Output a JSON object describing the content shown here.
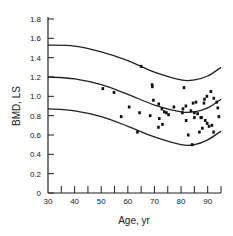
{
  "chart_data": {
    "type": "scatter",
    "title": "",
    "xlabel": "Age, yr",
    "ylabel": "BMD, LS",
    "xlim": [
      30,
      95
    ],
    "ylim": [
      0,
      1.8
    ],
    "xticks": [
      30,
      40,
      50,
      60,
      70,
      80,
      90
    ],
    "xminor_ticks": [
      35,
      45,
      55,
      65,
      75,
      85,
      95
    ],
    "yticks": [
      0,
      0.2,
      0.4,
      0.6,
      0.8,
      1.0,
      1.2,
      1.4,
      1.6,
      1.8
    ],
    "ytick_labels": [
      "0",
      "0.2",
      "0.4",
      "0.6",
      "0.8",
      "1.0",
      "1.2",
      "1.4",
      "1.6",
      "1.8"
    ],
    "grid": false,
    "legend": null,
    "reference_curves": [
      {
        "name": "upper",
        "x": [
          30,
          40,
          50,
          60,
          70,
          80,
          85,
          90,
          95
        ],
        "y": [
          1.53,
          1.52,
          1.46,
          1.37,
          1.25,
          1.17,
          1.17,
          1.21,
          1.3
        ]
      },
      {
        "name": "mean",
        "x": [
          30,
          40,
          50,
          60,
          70,
          80,
          85,
          90,
          95
        ],
        "y": [
          1.2,
          1.18,
          1.12,
          1.02,
          0.91,
          0.84,
          0.84,
          0.88,
          0.97
        ]
      },
      {
        "name": "lower",
        "x": [
          30,
          40,
          50,
          60,
          70,
          80,
          85,
          90,
          95
        ],
        "y": [
          0.87,
          0.85,
          0.79,
          0.69,
          0.58,
          0.5,
          0.5,
          0.55,
          0.64
        ]
      }
    ],
    "series": [
      {
        "name": "patients",
        "points": [
          [
            50.6,
            1.08
          ],
          [
            54.8,
            1.04
          ],
          [
            57.5,
            0.79
          ],
          [
            60.5,
            0.89
          ],
          [
            63.6,
            0.63
          ],
          [
            64.4,
            0.83
          ],
          [
            65.0,
            1.31
          ],
          [
            69.1,
            1.12
          ],
          [
            69.2,
            1.1
          ],
          [
            69.6,
            0.96
          ],
          [
            71.6,
            0.92
          ],
          [
            72.8,
            0.87
          ],
          [
            73.7,
            0.84
          ],
          [
            74.5,
            0.83
          ],
          [
            75.3,
            0.81
          ],
          [
            68.4,
            0.8
          ],
          [
            71.8,
            0.77
          ],
          [
            73.0,
            0.71
          ],
          [
            71.5,
            0.68
          ],
          [
            77.3,
            0.89
          ],
          [
            80.7,
            0.87
          ],
          [
            81.1,
            1.09
          ],
          [
            81.8,
            0.9
          ],
          [
            80.5,
            0.83
          ],
          [
            81.9,
            0.75
          ],
          [
            84.5,
            0.93
          ],
          [
            85.6,
            0.94
          ],
          [
            88.6,
            0.93
          ],
          [
            88.8,
            0.97
          ],
          [
            89.7,
            1.0
          ],
          [
            91.2,
            1.05
          ],
          [
            92.3,
            0.98
          ],
          [
            93.4,
            0.94
          ],
          [
            93.8,
            0.88
          ],
          [
            94.2,
            0.79
          ],
          [
            83.7,
            0.85
          ],
          [
            85.0,
            0.83
          ],
          [
            86.2,
            0.82
          ],
          [
            87.4,
            0.78
          ],
          [
            85.0,
            0.78
          ],
          [
            87.7,
            0.78
          ],
          [
            89.1,
            0.75
          ],
          [
            89.8,
            0.72
          ],
          [
            90.5,
            0.69
          ],
          [
            88.0,
            0.67
          ],
          [
            91.6,
            0.7
          ],
          [
            86.9,
            0.63
          ],
          [
            92.2,
            0.63
          ],
          [
            82.7,
            0.6
          ],
          [
            84.2,
            0.5
          ]
        ]
      }
    ]
  }
}
